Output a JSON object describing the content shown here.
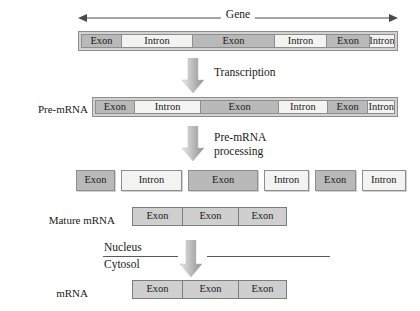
{
  "diagram": {
    "colors": {
      "exon_fill": "#b9b9b9",
      "intron_fill": "#f3f3f1",
      "segment_border": "#8e8e8e",
      "bar_frame": "#d2d2d2",
      "arrow_dark": "#9a9a9a",
      "arrow_light": "#e6e6e6",
      "text": "#1a1a1a",
      "divider": "#5a5a5a",
      "background": "#ffffff"
    }
  },
  "gene_span": {
    "label": "Gene",
    "left_arrowhead": "arrow-left",
    "right_arrowhead": "arrow-right"
  },
  "rows": {
    "gene": {
      "label": "",
      "segments": [
        {
          "type": "exon",
          "label": "Exon"
        },
        {
          "type": "intron",
          "label": "Intron"
        },
        {
          "type": "exon",
          "label": "Exon"
        },
        {
          "type": "intron",
          "label": "Intron"
        },
        {
          "type": "exon",
          "label": "Exon"
        },
        {
          "type": "intron",
          "label": "Intron"
        }
      ]
    },
    "pre_mrna": {
      "label": "Pre-mRNA",
      "segments": [
        {
          "type": "exon",
          "label": "Exon"
        },
        {
          "type": "intron",
          "label": "Intron"
        },
        {
          "type": "exon",
          "label": "Exon"
        },
        {
          "type": "intron",
          "label": "Intron"
        },
        {
          "type": "exon",
          "label": "Exon"
        },
        {
          "type": "intron",
          "label": "Intron"
        }
      ]
    },
    "separated": {
      "label": "",
      "segments": [
        {
          "type": "exon",
          "label": "Exon"
        },
        {
          "type": "intron",
          "label": "Intron"
        },
        {
          "type": "exon",
          "label": "Exon"
        },
        {
          "type": "intron",
          "label": "Intron"
        },
        {
          "type": "exon",
          "label": "Exon"
        },
        {
          "type": "intron",
          "label": "Intron"
        }
      ]
    },
    "mature_mrna": {
      "label": "Mature mRNA",
      "segments": [
        {
          "type": "exon",
          "label": "Exon"
        },
        {
          "type": "exon",
          "label": "Exon"
        },
        {
          "type": "exon",
          "label": "Exon"
        }
      ]
    },
    "mrna": {
      "label": "mRNA",
      "segments": [
        {
          "type": "exon",
          "label": "Exon"
        },
        {
          "type": "exon",
          "label": "Exon"
        },
        {
          "type": "exon",
          "label": "Exon"
        }
      ]
    }
  },
  "steps": {
    "transcription": {
      "label": "Transcription",
      "icon": "down-block-arrow"
    },
    "processing": {
      "line1": "Pre-mRNA",
      "line2": "processing",
      "icon": "down-block-arrow"
    },
    "export": {
      "icon": "down-block-arrow"
    }
  },
  "compartments": {
    "nucleus": "Nucleus",
    "cytosol": "Cytosol"
  }
}
